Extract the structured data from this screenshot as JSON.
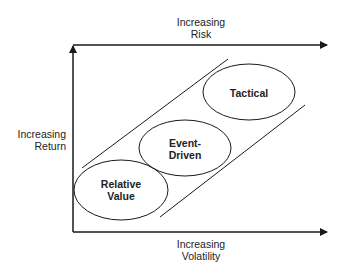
{
  "diagram": {
    "axes": {
      "top": {
        "line1": "Increasing",
        "line2": "Risk"
      },
      "left": {
        "line1": "Increasing",
        "line2": "Return"
      },
      "bottom": {
        "line1": "Increasing",
        "line2": "Volatility"
      }
    },
    "strategies": [
      {
        "line1": "Relative",
        "line2": "Value"
      },
      {
        "line1": "Event-",
        "line2": "Driven"
      },
      {
        "line1": "Tactical",
        "line2": ""
      }
    ],
    "colors": {
      "stroke": "#1a1a1a",
      "background": "#ffffff"
    }
  }
}
